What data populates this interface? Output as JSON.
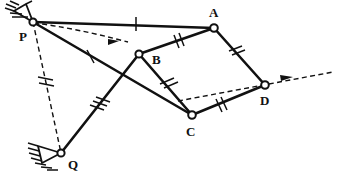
{
  "diagram": {
    "type": "kinematic-linkage-diagram",
    "canvas": {
      "width": 337,
      "height": 176,
      "background": "#ffffff"
    },
    "stroke_color": "#111111",
    "joint_fill": "#ffffff"
  },
  "joints": [
    {
      "id": "P",
      "label": "P",
      "x": 33,
      "y": 22,
      "r": 3.6,
      "kind": "fixed-pivot",
      "label_x": 19,
      "label_y": 40
    },
    {
      "id": "A",
      "label": "A",
      "x": 214,
      "y": 28,
      "r": 3.8,
      "kind": "pin-joint",
      "label_x": 210,
      "label_y": 16
    },
    {
      "id": "B",
      "label": "B",
      "x": 139,
      "y": 54,
      "r": 3.6,
      "kind": "pin-joint",
      "label_x": 152,
      "label_y": 63
    },
    {
      "id": "C",
      "label": "C",
      "x": 192,
      "y": 115,
      "r": 3.8,
      "kind": "pin-joint",
      "label_x": 186,
      "label_y": 134
    },
    {
      "id": "D",
      "label": "D",
      "x": 265,
      "y": 85,
      "r": 3.8,
      "kind": "pin-joint",
      "label_x": 261,
      "label_y": 104
    },
    {
      "id": "Q",
      "label": "Q",
      "x": 61,
      "y": 153,
      "r": 3.6,
      "kind": "fixed-pivot",
      "label_x": 67,
      "label_y": 168
    }
  ],
  "links": [
    {
      "id": "PA",
      "from": "P",
      "to": "A",
      "style": "solid",
      "ticks": 1
    },
    {
      "id": "AB",
      "from": "A",
      "to": "B",
      "style": "solid",
      "ticks": 2
    },
    {
      "id": "AD",
      "from": "A",
      "to": "D",
      "style": "solid",
      "ticks": 2
    },
    {
      "id": "BC",
      "from": "B",
      "to": "C",
      "style": "solid",
      "ticks": 2
    },
    {
      "id": "CD",
      "from": "C",
      "to": "D",
      "style": "solid",
      "ticks": 2
    },
    {
      "id": "PC",
      "from": "P",
      "to": "C",
      "style": "solid",
      "ticks": 1
    },
    {
      "id": "BQ",
      "from": "B",
      "to": "Q",
      "style": "solid",
      "ticks": 3
    },
    {
      "id": "PQ",
      "from": "P",
      "to": "Q",
      "style": "dashed",
      "ticks": 2
    }
  ],
  "vectors": [
    {
      "id": "vB",
      "from_x": 33,
      "from_y": 22,
      "to_x": 126,
      "to_y": 42,
      "style": "dashed",
      "arrow": "end",
      "curved": true
    },
    {
      "id": "vD",
      "from_x": 178,
      "from_y": 101,
      "to_x": 330,
      "to_y": 73,
      "style": "dashed",
      "arrow": "end",
      "curved": false
    }
  ],
  "grounds": [
    {
      "at": "P",
      "orientation": "upper-left",
      "hatch_count": 5
    },
    {
      "at": "Q",
      "orientation": "lower-left",
      "hatch_count": 5
    }
  ]
}
